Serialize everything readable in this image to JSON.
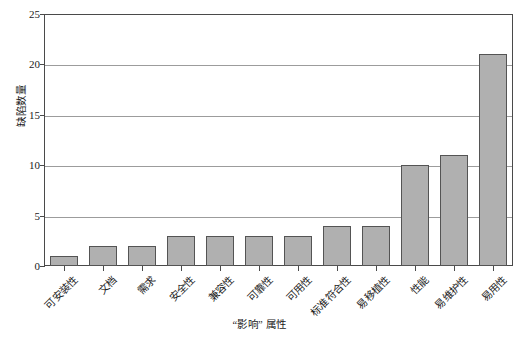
{
  "chart_data": {
    "type": "bar",
    "title": "",
    "subtitle": "",
    "xlabel": "“影响” 属性",
    "ylabel": "缺陷数量",
    "categories": [
      "可安装性",
      "文档",
      "需求",
      "安全性",
      "兼容性",
      "可靠性",
      "可用性",
      "标准符合性",
      "易移植性",
      "性能",
      "易维护性",
      "易用性"
    ],
    "values": [
      1,
      2,
      2,
      3,
      3,
      3,
      3,
      4,
      4,
      10,
      11,
      21
    ],
    "ylim": [
      0,
      25
    ],
    "yticks": [
      0,
      5,
      10,
      15,
      20,
      25
    ],
    "ytick_labels": [
      "0",
      "5",
      "10",
      "15",
      "20",
      "25"
    ],
    "grid": true,
    "grid_axis": "y",
    "legend": false,
    "legend_position": "none",
    "bar_fill_color": "#b0b0b0",
    "bar_edge_color": "#545454",
    "gridline_color": "#9c9c9c",
    "axis_color": "#4a4a4a",
    "background_color": "#ffffff"
  }
}
